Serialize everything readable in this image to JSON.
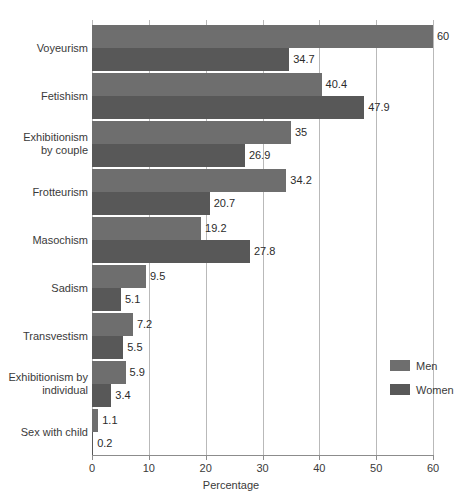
{
  "chart_data": {
    "type": "bar",
    "orientation": "horizontal",
    "title": "",
    "xlabel": "Percentage",
    "ylabel": "",
    "xlim": [
      0,
      60
    ],
    "xticks": [
      0,
      10,
      20,
      30,
      40,
      50,
      60
    ],
    "grid": true,
    "legend_position": "inside-right",
    "categories": [
      "Voyeurism",
      "Fetishism",
      "Exhibitionism\nby couple",
      "Frotteurism",
      "Masochism",
      "Sadism",
      "Transvestism",
      "Exhibitionism by\nindividual",
      "Sex with child"
    ],
    "series": [
      {
        "name": "Men",
        "color": "#6e6e6e",
        "values": [
          60,
          40.4,
          35,
          34.2,
          19.2,
          9.5,
          7.2,
          5.9,
          1.1
        ],
        "labels": [
          "60",
          "40.4",
          "35",
          "34.2",
          "19.2",
          "9.5",
          "7.2",
          "5.9",
          "1.1"
        ]
      },
      {
        "name": "Women",
        "color": "#585858",
        "values": [
          34.7,
          47.9,
          26.9,
          20.7,
          27.8,
          5.1,
          5.5,
          3.4,
          0.2
        ],
        "labels": [
          "34.7",
          "47.9",
          "26.9",
          "20.7",
          "27.8",
          "5.1",
          "5.5",
          "3.4",
          "0.2"
        ]
      }
    ]
  },
  "legend": {
    "items": [
      {
        "label": "Men",
        "color": "#6e6e6e"
      },
      {
        "label": "Women",
        "color": "#585858"
      }
    ]
  },
  "axis": {
    "x_title": "Percentage",
    "tick_labels": [
      "0",
      "10",
      "20",
      "30",
      "40",
      "50",
      "60"
    ]
  }
}
